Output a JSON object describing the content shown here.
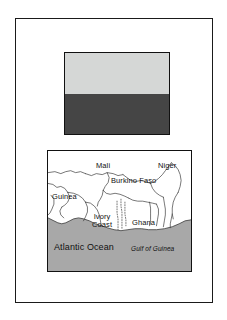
{
  "page": {
    "background_color": "#ffffff",
    "border_color": "#1a1a1a"
  },
  "flag": {
    "name": "flag-of-ghana-grayscale",
    "border_color": "#111111",
    "bands": [
      {
        "name": "top-band",
        "color": "#d5d7d6"
      },
      {
        "name": "bottom-band",
        "color": "#454545"
      }
    ]
  },
  "map": {
    "name": "west-africa-map",
    "border_color": "#111111",
    "land_color": "#ffffff",
    "ocean_color": "#a8a8a8",
    "border_line_color": "#3a3a3a",
    "labels": {
      "mali": "Mali",
      "niger": "Niger",
      "burkino_faso": "Burkino Faso",
      "guinea": "Guinea",
      "ivory_coast_line1": "Ivory",
      "ivory_coast_line2": "Coast",
      "ghana": "Ghana",
      "atlantic_ocean": "Atlantic Ocean",
      "gulf_of_guinea": "Gulf of Guinea"
    }
  }
}
